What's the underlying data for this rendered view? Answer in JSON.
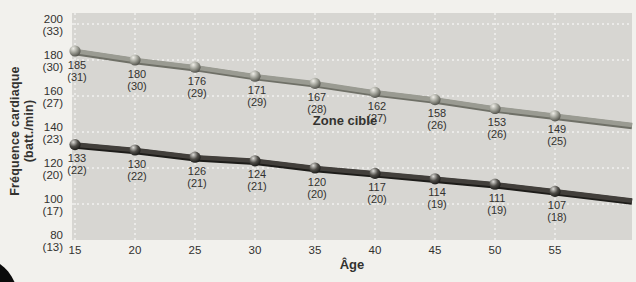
{
  "chart_data": {
    "type": "line",
    "xlabel": "Âge",
    "ylabel": "Fréquence cardiaque (batt./min)",
    "ylabel_lines": [
      "Fréquence cardiaque",
      "(batt./min)"
    ],
    "annotation": "Zone cible",
    "x": [
      15,
      20,
      25,
      30,
      35,
      40,
      45,
      50,
      55
    ],
    "xlim": [
      15,
      55
    ],
    "ylim": [
      80,
      200
    ],
    "yticks": [
      {
        "value": 200,
        "label": "200",
        "sublabel": "(33)"
      },
      {
        "value": 180,
        "label": "180",
        "sublabel": "(30)"
      },
      {
        "value": 160,
        "label": "160",
        "sublabel": "(27)"
      },
      {
        "value": 140,
        "label": "140",
        "sublabel": "(23)"
      },
      {
        "value": 120,
        "label": "120",
        "sublabel": "(20)"
      },
      {
        "value": 100,
        "label": "100",
        "sublabel": "(17)"
      },
      {
        "value": 80,
        "label": "80",
        "sublabel": "(13)"
      }
    ],
    "grid": {
      "style": "dashed",
      "color": "#ffffff"
    },
    "legend": "none",
    "series": [
      {
        "id": "upper",
        "values": [
          185,
          180,
          176,
          171,
          167,
          162,
          158,
          153,
          149
        ],
        "point_sublabels": [
          "(31)",
          "(30)",
          "(29)",
          "(29)",
          "(28)",
          "(27)",
          "(26)",
          "(26)",
          "(25)"
        ],
        "line_color": "#9a9b92",
        "line_shadow": "#6f7067",
        "marker": "sphere",
        "marker_colors": [
          "#efeee8",
          "#9a9b92",
          "#45453f"
        ]
      },
      {
        "id": "lower",
        "values": [
          133,
          130,
          126,
          124,
          120,
          117,
          114,
          111,
          107
        ],
        "point_sublabels": [
          "(22)",
          "(22)",
          "(21)",
          "(21)",
          "(20)",
          "(20)",
          "(19)",
          "(19)",
          "(18)"
        ],
        "line_color": "#423f3b",
        "line_shadow": "#1d1c19",
        "marker": "sphere",
        "marker_colors": [
          "#dddcd8",
          "#4e4c47",
          "#121210"
        ]
      }
    ],
    "colors": {
      "page_bg": "#f2f1ed",
      "plot_bg": "#d7d6d2",
      "grid": "#ffffff",
      "text": "#33322f",
      "corner_decoration": "#0b0b0b"
    }
  }
}
